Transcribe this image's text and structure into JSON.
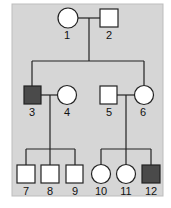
{
  "diagram": {
    "type": "pedigree",
    "colors": {
      "background": "#d6d6d6",
      "affected": "#4a4a4a",
      "unaffected": "#ffffff",
      "line": "#222222"
    },
    "individuals": [
      {
        "id": "1",
        "sex": "female",
        "affected": false,
        "generation": 1
      },
      {
        "id": "2",
        "sex": "male",
        "affected": false,
        "generation": 1
      },
      {
        "id": "3",
        "sex": "male",
        "affected": true,
        "generation": 2
      },
      {
        "id": "4",
        "sex": "female",
        "affected": false,
        "generation": 2
      },
      {
        "id": "5",
        "sex": "male",
        "affected": false,
        "generation": 2
      },
      {
        "id": "6",
        "sex": "female",
        "affected": false,
        "generation": 2
      },
      {
        "id": "7",
        "sex": "male",
        "affected": false,
        "generation": 3
      },
      {
        "id": "8",
        "sex": "male",
        "affected": false,
        "generation": 3
      },
      {
        "id": "9",
        "sex": "male",
        "affected": false,
        "generation": 3
      },
      {
        "id": "10",
        "sex": "female",
        "affected": false,
        "generation": 3
      },
      {
        "id": "11",
        "sex": "female",
        "affected": false,
        "generation": 3
      },
      {
        "id": "12",
        "sex": "male",
        "affected": true,
        "generation": 3
      }
    ],
    "labels": {
      "l1": "1",
      "l2": "2",
      "l3": "3",
      "l4": "4",
      "l5": "5",
      "l6": "6",
      "l7": "7",
      "l8": "8",
      "l9": "9",
      "l10": "10",
      "l11": "11",
      "l12": "12"
    }
  }
}
